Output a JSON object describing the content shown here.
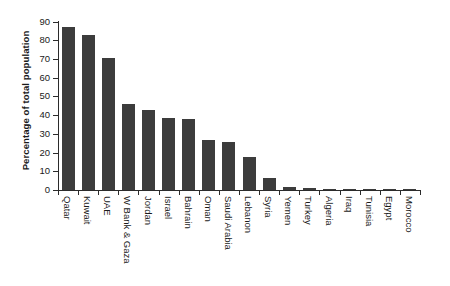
{
  "chart_data": {
    "type": "bar",
    "title": "",
    "xlabel": "",
    "ylabel": "Percentage of total population",
    "ylim": [
      0,
      90
    ],
    "ytick_labels": [
      "0",
      "10",
      "20",
      "30",
      "40",
      "50",
      "60",
      "70",
      "80",
      "90"
    ],
    "yticks": [
      0,
      10,
      20,
      30,
      40,
      50,
      60,
      70,
      80,
      90
    ],
    "grid": false,
    "legend": false,
    "bar_color": "#3c3c3c",
    "axis_color": "#2b2b2b",
    "background_color": "#ffffff",
    "categories": [
      "Qatar",
      "Kuwait",
      "UAE",
      "W Bank & Gaza",
      "Jordan",
      "Israel",
      "Bahrain",
      "Oman",
      "Saudi Arabia",
      "Lebanon",
      "Syria",
      "Yemen",
      "Turkey",
      "Algeria",
      "Iraq",
      "Tunisia",
      "Egypt",
      "Morocco"
    ],
    "values": [
      87.2,
      82.6,
      70.4,
      46.2,
      42.8,
      38.2,
      38.1,
      26.9,
      25.9,
      17.4,
      6.4,
      1.6,
      1.2,
      0.4,
      0.3,
      0.3,
      0.2,
      0.1
    ]
  }
}
